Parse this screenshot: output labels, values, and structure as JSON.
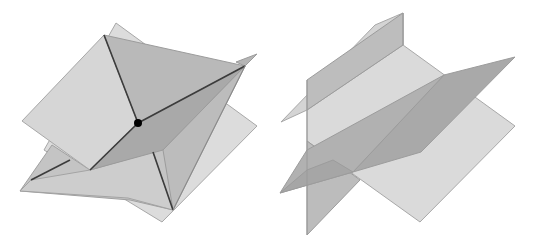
{
  "figure": {
    "title": "Intersecting planes in 3D",
    "panels": [
      {
        "id": "left",
        "description": "Three planes intersecting at a single point",
        "point_label": "intersection-point"
      },
      {
        "id": "right",
        "description": "Three planes intersecting along parallel lines (no common point)"
      }
    ],
    "colors": {
      "light_plane": "#d9d9d9",
      "mid_plane": "#bdbdbd",
      "dark_plane": "#a9a9a9",
      "edge": "#9a9a9a",
      "line": "#3c3c3c",
      "point": "#000000",
      "background": "#ffffff"
    }
  }
}
